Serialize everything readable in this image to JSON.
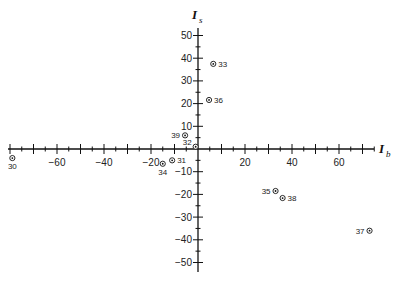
{
  "chart_data": {
    "type": "scatter",
    "title": "",
    "xlabel": "I_b",
    "ylabel": "I_s",
    "xlim": [
      -82,
      76
    ],
    "ylim": [
      -55,
      55
    ],
    "grid": false,
    "x_ticks": [
      -60,
      -40,
      -20,
      20,
      40,
      60
    ],
    "y_ticks": [
      50,
      40,
      30,
      20,
      10,
      -10,
      -20,
      -30,
      -40,
      -50
    ],
    "marker": "circled-dot",
    "points": [
      {
        "label": "30",
        "x": -79,
        "y": -4,
        "label_pos": "below"
      },
      {
        "label": "31",
        "x": -11,
        "y": -5,
        "label_pos": "right"
      },
      {
        "label": "32",
        "x": -1,
        "y": 1,
        "label_pos": "upper-left"
      },
      {
        "label": "33",
        "x": 6.5,
        "y": 37.5,
        "label_pos": "right"
      },
      {
        "label": "34",
        "x": -15,
        "y": -6.5,
        "label_pos": "below"
      },
      {
        "label": "35",
        "x": 33,
        "y": -18.5,
        "label_pos": "left"
      },
      {
        "label": "36",
        "x": 4.7,
        "y": 21.6,
        "label_pos": "right"
      },
      {
        "label": "37",
        "x": 73,
        "y": -36,
        "label_pos": "left"
      },
      {
        "label": "38",
        "x": 36,
        "y": -21.6,
        "label_pos": "right"
      },
      {
        "label": "39",
        "x": -5.5,
        "y": 6,
        "label_pos": "left"
      }
    ]
  },
  "axes": {
    "x_title_main": "I",
    "x_title_sub": "b",
    "y_title_main": "I",
    "y_title_sub": "s"
  }
}
